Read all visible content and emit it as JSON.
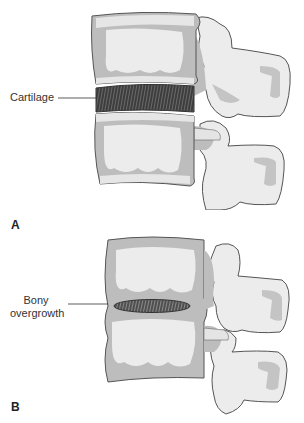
{
  "figure": {
    "panels": [
      {
        "id": "A",
        "letter": "A",
        "label": "Cartilage",
        "description": "Two vertebrae separated by a healthy intervertebral disc of cartilage"
      },
      {
        "id": "B",
        "letter": "B",
        "label_line1": "Bony",
        "label_line2": "overgrowth",
        "description": "Two vertebrae fused by bony overgrowth with a narrowed remnant disc"
      }
    ],
    "colors": {
      "bone_outline": "#555555",
      "bone_gray": "#bdbdbd",
      "bone_light": "#ececec",
      "cartilage_dark": "#3a3a3a",
      "background": "#ffffff"
    }
  }
}
